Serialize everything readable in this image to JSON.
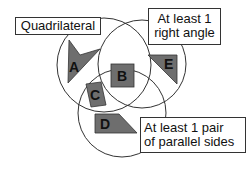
{
  "diagram": {
    "type": "venn",
    "colors": {
      "shape_fill": "#6e6e6e",
      "circle_stroke": "#333333",
      "background": "#ffffff"
    },
    "sets": [
      {
        "id": "quadrilateral",
        "label": "Quadrilateral"
      },
      {
        "id": "right_angle",
        "label_line1": "At least 1",
        "label_line2": "right angle"
      },
      {
        "id": "parallel",
        "label_line1": "At least 1 pair",
        "label_line2": "of parallel sides"
      }
    ],
    "shapes": [
      {
        "letter": "A",
        "region": "Quadrilateral only"
      },
      {
        "letter": "B",
        "region": "Quadrilateral, right angle and parallel sides"
      },
      {
        "letter": "C",
        "region": "Quadrilateral and parallel sides"
      },
      {
        "letter": "D",
        "region": "At least 1 pair of parallel sides"
      },
      {
        "letter": "E",
        "region": "At least 1 right angle"
      }
    ]
  }
}
